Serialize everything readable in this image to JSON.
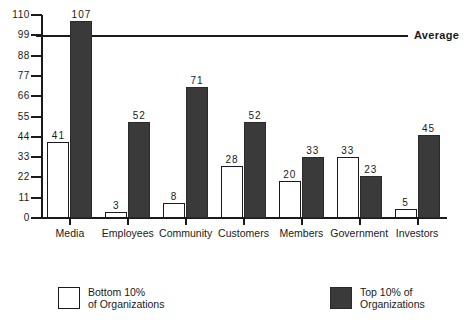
{
  "chart_data": {
    "type": "bar",
    "title": "",
    "xlabel": "",
    "ylabel": "",
    "ylim": [
      0,
      110
    ],
    "ytick_step": 11,
    "ytick_labels": [
      "0",
      "11",
      "22",
      "33",
      "44",
      "55",
      "66",
      "77",
      "88",
      "99",
      "110"
    ],
    "ytick_values": [
      0,
      11,
      22,
      33,
      44,
      55,
      66,
      77,
      88,
      99,
      110
    ],
    "grid": false,
    "legend_position": "bottom",
    "categories": [
      "Media",
      "Employees",
      "Community",
      "Customers",
      "Members",
      "Government",
      "Investors"
    ],
    "series": [
      {
        "name": "Bottom 10% of Organizations",
        "style": "hollow",
        "color": "#ffffff",
        "values": [
          41,
          3,
          8,
          28,
          20,
          33,
          5
        ]
      },
      {
        "name": "Top 10% of Organizations",
        "style": "filled",
        "color": "#3a3a3a",
        "values": [
          107,
          52,
          71,
          52,
          33,
          23,
          45
        ]
      }
    ],
    "annotations": [
      {
        "name": "average-line",
        "label": "Average",
        "value": 99,
        "orientation": "horizontal"
      }
    ]
  },
  "legend": {
    "bottom": {
      "line1": "Bottom  10%",
      "line2": "of  Organizations"
    },
    "top": {
      "line1": "Top 10% of",
      "line2": "Organizations"
    }
  },
  "average": {
    "label": "Average"
  }
}
